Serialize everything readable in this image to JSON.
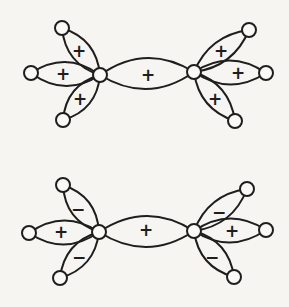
{
  "figure": {
    "kind": "molecular-orbital-diagram",
    "canvas": {
      "width": 289,
      "height": 307
    },
    "colors": {
      "background": "#f6f5f2",
      "line": "#1e1e1e",
      "node_fill": "#faf9f6"
    },
    "node_radius": 7,
    "diagrams": [
      {
        "id": "top",
        "carbons": [
          [
            100,
            75
          ],
          [
            194,
            72
          ]
        ],
        "hydrogens": [
          [
            62,
            28
          ],
          [
            31,
            73
          ],
          [
            63,
            120
          ],
          [
            249,
            30
          ],
          [
            266,
            73
          ],
          [
            235,
            121
          ]
        ],
        "lobes": [
          {
            "name": "cc-sigma",
            "from": [
              100,
              75
            ],
            "to": [
              194,
              72
            ],
            "bulge": 15.5,
            "sign": "+",
            "sign_at": [
              148,
              75
            ]
          },
          {
            "name": "left-upper-ch",
            "from": [
              100,
              75
            ],
            "to": [
              62,
              28
            ],
            "bulge": 10,
            "sign": "+",
            "sign_at": [
              79,
              51
            ]
          },
          {
            "name": "left-horizontal-ch",
            "from": [
              100,
              75
            ],
            "to": [
              31,
              73
            ],
            "bulge": 12,
            "sign": "+",
            "sign_at": [
              63,
              74
            ]
          },
          {
            "name": "left-lower-ch",
            "from": [
              100,
              75
            ],
            "to": [
              63,
              120
            ],
            "bulge": 10,
            "sign": "+",
            "sign_at": [
              80,
              99
            ]
          },
          {
            "name": "right-upper-ch",
            "from": [
              194,
              72
            ],
            "to": [
              249,
              30
            ],
            "bulge": 10,
            "sign": "+",
            "sign_at": [
              221,
              51
            ]
          },
          {
            "name": "right-horizontal-ch",
            "from": [
              194,
              72
            ],
            "to": [
              266,
              73
            ],
            "bulge": 12,
            "sign": "+",
            "sign_at": [
              238,
              73
            ]
          },
          {
            "name": "right-lower-ch",
            "from": [
              194,
              72
            ],
            "to": [
              235,
              121
            ],
            "bulge": 10,
            "sign": "+",
            "sign_at": [
              215,
              99
            ]
          }
        ]
      },
      {
        "id": "bottom",
        "carbons": [
          [
            99,
            232
          ],
          [
            194,
            231
          ]
        ],
        "hydrogens": [
          [
            63,
            185
          ],
          [
            29,
            233
          ],
          [
            60,
            278
          ],
          [
            247,
            189
          ],
          [
            266,
            230
          ],
          [
            234,
            277
          ]
        ],
        "lobes": [
          {
            "name": "cc-sigma",
            "from": [
              99,
              232
            ],
            "to": [
              194,
              231
            ],
            "bulge": 15.5,
            "sign": "+",
            "sign_at": [
              146,
              230
            ]
          },
          {
            "name": "left-upper-ch",
            "from": [
              99,
              232
            ],
            "to": [
              63,
              185
            ],
            "bulge": 10,
            "sign": "−",
            "sign_at": [
              78,
              209
            ]
          },
          {
            "name": "left-horizontal-ch",
            "from": [
              99,
              232
            ],
            "to": [
              29,
              233
            ],
            "bulge": 12,
            "sign": "+",
            "sign_at": [
              61,
              232
            ]
          },
          {
            "name": "left-lower-ch",
            "from": [
              99,
              232
            ],
            "to": [
              60,
              278
            ],
            "bulge": 10,
            "sign": "−",
            "sign_at": [
              79,
              257
            ]
          },
          {
            "name": "right-upper-ch",
            "from": [
              194,
              231
            ],
            "to": [
              247,
              189
            ],
            "bulge": 10,
            "sign": "−",
            "sign_at": [
              219,
              212
            ]
          },
          {
            "name": "right-horizontal-ch",
            "from": [
              194,
              231
            ],
            "to": [
              266,
              230
            ],
            "bulge": 12,
            "sign": "+",
            "sign_at": [
              232,
              231
            ]
          },
          {
            "name": "right-lower-ch",
            "from": [
              194,
              231
            ],
            "to": [
              234,
              277
            ],
            "bulge": 10,
            "sign": "−",
            "sign_at": [
              212,
              257
            ]
          }
        ]
      }
    ]
  }
}
